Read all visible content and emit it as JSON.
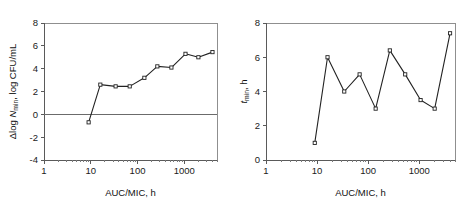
{
  "figure": {
    "background": "#ffffff",
    "line_color": "#222222",
    "axis_color": "#5a5a5a",
    "frame_color": "#8f8f8f"
  },
  "chart_data": [
    {
      "id": "left",
      "type": "line",
      "title": "",
      "xlabel": "AUC/MIC, h",
      "ylabel": "Δlog N_min, log CFU/mL",
      "ylabel_parts": {
        "prefix": "Δlog ",
        "italic": "N",
        "subscript": "min",
        "suffix": ", log CFU/mL"
      },
      "xscale": "log",
      "xlim": [
        1,
        5000
      ],
      "ylim": [
        -4,
        8
      ],
      "xticks": [
        1,
        10,
        100,
        1000
      ],
      "xticklabels": [
        "1",
        "10",
        "100",
        "1000"
      ],
      "yticks": [
        -4,
        -2,
        0,
        2,
        4,
        6,
        8
      ],
      "yticklabels": [
        "-4",
        "-2",
        "0",
        "2",
        "4",
        "6",
        "8"
      ],
      "grid": false,
      "legend": "none",
      "reference_line": {
        "axis": "y",
        "value": 0
      },
      "marker": "open-square",
      "x": [
        9,
        16,
        34,
        68,
        140,
        265,
        530,
        1060,
        2000,
        4000
      ],
      "y": [
        -0.7,
        2.6,
        2.45,
        2.45,
        3.2,
        4.2,
        4.1,
        5.3,
        5.0,
        5.45
      ]
    },
    {
      "id": "right",
      "type": "line",
      "title": "",
      "xlabel": "AUC/MIC, h",
      "ylabel": "t_min, h",
      "ylabel_parts": {
        "prefix": "",
        "italic": "t",
        "subscript": "min",
        "suffix": ", h"
      },
      "xscale": "log",
      "xlim": [
        1,
        5000
      ],
      "ylim": [
        0,
        8
      ],
      "xticks": [
        1,
        10,
        100,
        1000
      ],
      "xticklabels": [
        "1",
        "10",
        "100",
        "1000"
      ],
      "yticks": [
        0,
        2,
        4,
        6,
        8
      ],
      "yticklabels": [
        "0",
        "2",
        "4",
        "6",
        "8"
      ],
      "grid": false,
      "legend": "none",
      "marker": "open-square",
      "x": [
        9,
        16,
        34,
        68,
        140,
        265,
        530,
        1060,
        2000,
        4000
      ],
      "y": [
        1.0,
        6.0,
        4.0,
        5.0,
        3.0,
        6.4,
        5.0,
        3.5,
        3.0,
        7.4
      ]
    }
  ]
}
